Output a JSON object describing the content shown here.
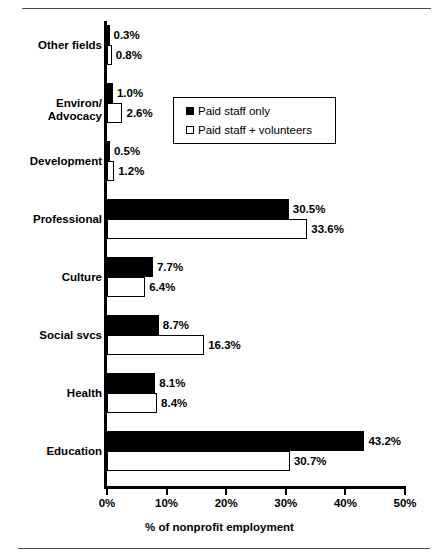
{
  "chart_data": {
    "type": "bar",
    "orientation": "horizontal",
    "title": "",
    "xlabel": "% of nonprofit employment",
    "ylabel": "",
    "xlim": [
      0,
      50
    ],
    "grid": false,
    "legend_position": "upper-center-inside",
    "tick_labels": [
      "0%",
      "10%",
      "20%",
      "30%",
      "40%",
      "50%"
    ],
    "tick_values": [
      0,
      10,
      20,
      30,
      40,
      50
    ],
    "categories": [
      "Other fields",
      "Environ/\nAdvocacy",
      "Development",
      "Professional",
      "Culture",
      "Social svcs",
      "Health",
      "Education"
    ],
    "series": [
      {
        "name": "Paid staff only",
        "style": "filled-black",
        "color": "#000000",
        "values": [
          0.3,
          1.0,
          0.5,
          30.5,
          7.7,
          8.7,
          8.1,
          43.2
        ],
        "labels": [
          "0.3%",
          "1.0%",
          "0.5%",
          "30.5%",
          "7.7%",
          "8.7%",
          "8.1%",
          "43.2%"
        ]
      },
      {
        "name": "Paid staff + volunteers",
        "style": "open-white",
        "color": "#ffffff",
        "values": [
          0.8,
          2.6,
          1.2,
          33.6,
          6.4,
          16.3,
          8.4,
          30.7
        ],
        "labels": [
          "0.8%",
          "2.6%",
          "1.2%",
          "33.6%",
          "6.4%",
          "16.3%",
          "8.4%",
          "30.7%"
        ]
      }
    ]
  },
  "legend": {
    "items": [
      {
        "label": "Paid staff only",
        "swatch": "filled-black-square-icon"
      },
      {
        "label": "Paid staff + volunteers",
        "swatch": "open-white-square-icon"
      }
    ]
  },
  "axis": {
    "x_title": "% of nonprofit employment"
  }
}
